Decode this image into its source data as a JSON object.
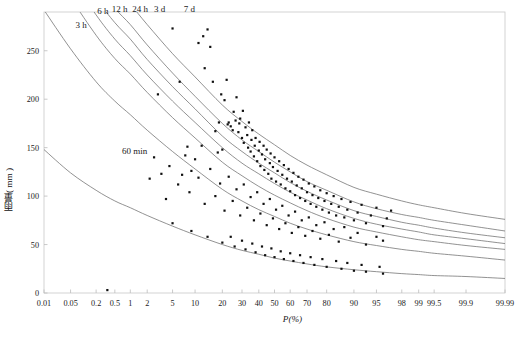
{
  "chart_data": {
    "type": "line",
    "title": "",
    "xlabel": "P(%)",
    "ylabel": "雨量( mm )",
    "xscale": "normal-probability",
    "xlim": [
      0.01,
      99.99
    ],
    "ylim": [
      0,
      290
    ],
    "grid": false,
    "legend": "inline-curve-labels",
    "x_ticks": [
      "0.01",
      "0.05",
      "0.2",
      "0.5",
      "1",
      "2",
      "5",
      "10",
      "20",
      "30",
      "40",
      "50",
      "60",
      "70",
      "80",
      "90",
      "95",
      "98",
      "99",
      "99.5",
      "99.9",
      "99.99"
    ],
    "x_tick_values": [
      0.01,
      0.05,
      0.2,
      0.5,
      1,
      2,
      5,
      10,
      20,
      30,
      40,
      50,
      60,
      70,
      80,
      90,
      95,
      98,
      99,
      99.5,
      99.9,
      99.99
    ],
    "y_ticks": [
      "0",
      "50",
      "100",
      "150",
      "200",
      "250"
    ],
    "y_tick_values": [
      0,
      50,
      100,
      150,
      200,
      250
    ],
    "series": [
      {
        "name": "60 min",
        "label": "60 min",
        "label_x": 1.2,
        "label_y": 143,
        "x": [
          0.01,
          0.05,
          0.2,
          0.5,
          1,
          2,
          5,
          10,
          20,
          30,
          40,
          50,
          60,
          70,
          80,
          90,
          95,
          98,
          99,
          99.5,
          99.9,
          99.99
        ],
        "values": [
          148,
          124,
          106,
          95,
          88,
          80,
          69,
          60,
          50,
          44,
          40,
          36,
          33,
          30,
          27,
          24,
          22,
          20,
          19,
          18,
          17,
          15
        ]
      },
      {
        "name": "3 h",
        "label": "3 h",
        "label_x": 0.09,
        "label_y": 274,
        "x": [
          0.01,
          0.05,
          0.2,
          0.5,
          1,
          2,
          5,
          10,
          20,
          30,
          40,
          50,
          60,
          70,
          80,
          90,
          95,
          98,
          99,
          99.5,
          99.9,
          99.99
        ],
        "values": [
          292,
          252,
          218,
          198,
          184,
          168,
          146,
          128,
          107,
          95,
          86,
          79,
          72,
          66,
          60,
          53,
          49,
          45,
          43,
          41,
          38,
          34
        ]
      },
      {
        "name": "6 h",
        "label": "6 h",
        "label_x": 0.28,
        "label_y": 288,
        "x": [
          0.01,
          0.05,
          0.2,
          0.5,
          1,
          2,
          5,
          10,
          20,
          30,
          40,
          50,
          60,
          70,
          80,
          90,
          95,
          98,
          99,
          99.5,
          99.9,
          99.99
        ],
        "values": [
          350,
          305,
          266,
          242,
          226,
          207,
          181,
          160,
          135,
          121,
          110,
          101,
          93,
          85,
          77,
          68,
          63,
          58,
          55,
          53,
          49,
          45
        ]
      },
      {
        "name": "12 h",
        "label": "12 h",
        "label_x": 0.62,
        "label_y": 290,
        "x": [
          0.01,
          0.05,
          0.2,
          0.5,
          1,
          2,
          5,
          10,
          20,
          30,
          40,
          50,
          60,
          70,
          80,
          90,
          95,
          98,
          99,
          99.5,
          99.9,
          99.99
        ],
        "values": [
          372,
          327,
          287,
          262,
          245,
          225,
          198,
          176,
          150,
          134,
          123,
          113,
          104,
          96,
          87,
          77,
          71,
          66,
          63,
          60,
          56,
          51
        ]
      },
      {
        "name": "24 h",
        "label": "24 h",
        "label_x": 1.5,
        "label_y": 290,
        "x": [
          0.01,
          0.05,
          0.2,
          0.5,
          1,
          2,
          5,
          10,
          20,
          30,
          40,
          50,
          60,
          70,
          80,
          90,
          95,
          98,
          99,
          99.5,
          99.9,
          99.99
        ],
        "values": [
          390,
          345,
          304,
          279,
          262,
          241,
          213,
          190,
          162,
          146,
          134,
          124,
          114,
          105,
          96,
          85,
          79,
          73,
          70,
          67,
          62,
          57
        ]
      },
      {
        "name": "3 d",
        "label": "3 d",
        "label_x": 3.2,
        "label_y": 290,
        "x": [
          0.01,
          0.05,
          0.2,
          0.5,
          1,
          2,
          5,
          10,
          20,
          30,
          40,
          50,
          60,
          70,
          80,
          90,
          95,
          98,
          99,
          99.5,
          99.9,
          99.99
        ],
        "values": [
          408,
          362,
          320,
          294,
          277,
          256,
          227,
          203,
          175,
          158,
          146,
          135,
          125,
          115,
          106,
          94,
          87,
          81,
          78,
          75,
          70,
          64
        ]
      },
      {
        "name": "7 d",
        "label": "7 d",
        "label_x": 8.5,
        "label_y": 290,
        "x": [
          0.01,
          0.05,
          0.2,
          0.5,
          1,
          2,
          5,
          10,
          20,
          30,
          40,
          50,
          60,
          70,
          80,
          90,
          95,
          98,
          99,
          99.5,
          99.9,
          99.99
        ],
        "values": [
          430,
          384,
          341,
          315,
          298,
          277,
          247,
          223,
          194,
          177,
          164,
          153,
          142,
          132,
          122,
          109,
          102,
          95,
          91,
          88,
          82,
          76
        ]
      }
    ],
    "scatter": {
      "name": "observed-data-points",
      "marker": "square",
      "points": [
        [
          0.35,
          3
        ],
        [
          3.0,
          205
        ],
        [
          5.0,
          273
        ],
        [
          6.3,
          218
        ],
        [
          8.0,
          151
        ],
        [
          9.0,
          126
        ],
        [
          11.0,
          258
        ],
        [
          12.5,
          265
        ],
        [
          13.0,
          232
        ],
        [
          14.0,
          272
        ],
        [
          15.0,
          254
        ],
        [
          16.0,
          218
        ],
        [
          17.0,
          167
        ],
        [
          18.5,
          176
        ],
        [
          19.5,
          205
        ],
        [
          20.0,
          148
        ],
        [
          21.0,
          199
        ],
        [
          22.0,
          220
        ],
        [
          22.5,
          174
        ],
        [
          23.0,
          176
        ],
        [
          24.0,
          172
        ],
        [
          25.0,
          168
        ],
        [
          25.5,
          187
        ],
        [
          26.5,
          178
        ],
        [
          27.0,
          202
        ],
        [
          28.0,
          166
        ],
        [
          28.5,
          175
        ],
        [
          29.0,
          180
        ],
        [
          30.0,
          160
        ],
        [
          30.5,
          188
        ],
        [
          31.0,
          155
        ],
        [
          32.0,
          171
        ],
        [
          33.0,
          163
        ],
        [
          33.5,
          150
        ],
        [
          34.0,
          176
        ],
        [
          35.0,
          146
        ],
        [
          35.5,
          158
        ],
        [
          36.0,
          168
        ],
        [
          37.0,
          141
        ],
        [
          37.5,
          152
        ],
        [
          38.0,
          160
        ],
        [
          39.0,
          136
        ],
        [
          40.0,
          147
        ],
        [
          40.5,
          156
        ],
        [
          41.0,
          131
        ],
        [
          42.0,
          143
        ],
        [
          43.0,
          152
        ],
        [
          43.5,
          127
        ],
        [
          44.0,
          138
        ],
        [
          45.0,
          148
        ],
        [
          46.0,
          123
        ],
        [
          47.0,
          134
        ],
        [
          47.5,
          144
        ],
        [
          48.0,
          118
        ],
        [
          49.0,
          130
        ],
        [
          50.0,
          140
        ],
        [
          51.0,
          115
        ],
        [
          52.0,
          126
        ],
        [
          53.0,
          136
        ],
        [
          54.0,
          112
        ],
        [
          55.0,
          122
        ],
        [
          56.0,
          132
        ],
        [
          57.0,
          108
        ],
        [
          58.0,
          118
        ],
        [
          59.0,
          128
        ],
        [
          60.0,
          105
        ],
        [
          61.0,
          115
        ],
        [
          62.0,
          124
        ],
        [
          63.0,
          101
        ],
        [
          64.0,
          111
        ],
        [
          65.0,
          120
        ],
        [
          66.0,
          98
        ],
        [
          67.0,
          108
        ],
        [
          68.0,
          117
        ],
        [
          69.0,
          95
        ],
        [
          70.0,
          104
        ],
        [
          71.0,
          113
        ],
        [
          72.0,
          92
        ],
        [
          73.0,
          101
        ],
        [
          74.0,
          110
        ],
        [
          75.0,
          89
        ],
        [
          76.0,
          98
        ],
        [
          77.0,
          106
        ],
        [
          78.0,
          86
        ],
        [
          79.0,
          95
        ],
        [
          80.0,
          103
        ],
        [
          81.0,
          83
        ],
        [
          82.0,
          92
        ],
        [
          83.0,
          100
        ],
        [
          84.0,
          80
        ],
        [
          85.0,
          89
        ],
        [
          86.0,
          97
        ],
        [
          87.0,
          78
        ],
        [
          88.0,
          86
        ],
        [
          89.0,
          94
        ],
        [
          90.0,
          75
        ],
        [
          91.0,
          83
        ],
        [
          92.0,
          91
        ],
        [
          93.0,
          72
        ],
        [
          94.0,
          80
        ],
        [
          95.0,
          88
        ],
        [
          96.0,
          69
        ],
        [
          96.5,
          77
        ],
        [
          97.0,
          85
        ],
        [
          4.0,
          97
        ],
        [
          6.0,
          112
        ],
        [
          8.5,
          104
        ],
        [
          11.0,
          119
        ],
        [
          13.0,
          92
        ],
        [
          15.0,
          128
        ],
        [
          17.0,
          100
        ],
        [
          19.0,
          113
        ],
        [
          21.0,
          85
        ],
        [
          23.0,
          120
        ],
        [
          25.0,
          95
        ],
        [
          27.0,
          107
        ],
        [
          29.0,
          80
        ],
        [
          31.0,
          112
        ],
        [
          33.0,
          88
        ],
        [
          35.0,
          99
        ],
        [
          37.0,
          75
        ],
        [
          39.0,
          104
        ],
        [
          41.0,
          82
        ],
        [
          43.0,
          92
        ],
        [
          45.0,
          70
        ],
        [
          47.0,
          97
        ],
        [
          49.0,
          77
        ],
        [
          51.0,
          86
        ],
        [
          53.0,
          66
        ],
        [
          55.0,
          90
        ],
        [
          57.0,
          72
        ],
        [
          59.0,
          80
        ],
        [
          61.0,
          62
        ],
        [
          63.0,
          84
        ],
        [
          65.0,
          68
        ],
        [
          67.0,
          75
        ],
        [
          69.0,
          59
        ],
        [
          71.0,
          78
        ],
        [
          73.0,
          64
        ],
        [
          75.0,
          70
        ],
        [
          77.0,
          56
        ],
        [
          79.0,
          73
        ],
        [
          81.0,
          60
        ],
        [
          83.0,
          66
        ],
        [
          85.0,
          53
        ],
        [
          87.0,
          68
        ],
        [
          89.0,
          57
        ],
        [
          91.0,
          62
        ],
        [
          93.0,
          50
        ],
        [
          95.0,
          58
        ],
        [
          96.0,
          54
        ],
        [
          5.0,
          72
        ],
        [
          9.0,
          64
        ],
        [
          14.0,
          58
        ],
        [
          20.0,
          52
        ],
        [
          26.0,
          48
        ],
        [
          32.0,
          45
        ],
        [
          38.0,
          42
        ],
        [
          44.0,
          39
        ],
        [
          50.0,
          37
        ],
        [
          56.0,
          35
        ],
        [
          62.0,
          33
        ],
        [
          68.0,
          31
        ],
        [
          74.0,
          29
        ],
        [
          80.0,
          27
        ],
        [
          86.0,
          25
        ],
        [
          90.0,
          23
        ],
        [
          93.0,
          22
        ],
        [
          96.0,
          20
        ],
        [
          2.2,
          118
        ],
        [
          2.6,
          140
        ],
        [
          3.4,
          123
        ],
        [
          4.5,
          131
        ],
        [
          6.8,
          122
        ],
        [
          7.5,
          142
        ],
        [
          10.0,
          138
        ],
        [
          12.0,
          152
        ],
        [
          18.0,
          145
        ],
        [
          24.0,
          58
        ],
        [
          30.0,
          54
        ],
        [
          36.0,
          51
        ],
        [
          42.0,
          48
        ],
        [
          48.0,
          46
        ],
        [
          54.0,
          43
        ],
        [
          60.0,
          41
        ],
        [
          66.0,
          39
        ],
        [
          72.0,
          37
        ],
        [
          78.0,
          35
        ],
        [
          84.0,
          33
        ],
        [
          88.0,
          31
        ],
        [
          92.0,
          29
        ],
        [
          95.5,
          27
        ]
      ]
    }
  },
  "axes": {
    "x_title": "P(%)",
    "y_title": "雨量( mm )"
  },
  "caption": {
    "text": ""
  }
}
